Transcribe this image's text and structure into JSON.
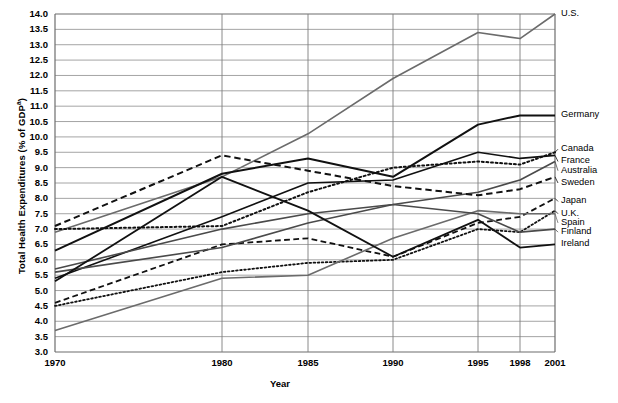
{
  "chart_data": {
    "type": "line",
    "title": "",
    "xlabel": "Year",
    "ylabel": "Total Health Expenditures (% of GDP",
    "ylabel_superscript": "a",
    "x": [
      1970,
      1980,
      1985,
      1990,
      1995,
      1998,
      2001
    ],
    "xtick_labels": [
      "1970",
      "1980",
      "1985",
      "1990",
      "1995",
      "1998",
      "2001"
    ],
    "ytick_labels": [
      "14.0",
      "13.5",
      "13.0",
      "12.5",
      "12.0",
      "11.5",
      "11.0",
      "10.5",
      "10.0",
      "9.5",
      "9.0",
      "8.5",
      "8.0",
      "7.5",
      "7.0",
      "6.5",
      "6.0",
      "5.5",
      "5.0",
      "4.5",
      "4.0",
      "3.5",
      "3.0"
    ],
    "ylim": [
      3.0,
      14.0
    ],
    "ytick_step": 0.5,
    "grid": true,
    "legend": "right-of-axis-series-labels",
    "series": [
      {
        "name": "U.S.",
        "values": [
          6.9,
          8.7,
          10.1,
          11.9,
          13.4,
          13.2,
          14.0
        ],
        "style": "solid",
        "color": "#6b6b6b",
        "width": 1.6,
        "label_y": 14.0
      },
      {
        "name": "Germany",
        "values": [
          6.3,
          8.8,
          9.3,
          8.7,
          10.4,
          10.7,
          10.7
        ],
        "style": "solid",
        "color": "#111111",
        "width": 2.0,
        "label_y": 10.7
      },
      {
        "name": "Canada",
        "values": [
          7.0,
          7.1,
          8.2,
          9.0,
          9.2,
          9.1,
          9.5
        ],
        "style": "dotted",
        "color": "#111111",
        "width": 2.0,
        "label_y": 9.6
      },
      {
        "name": "France",
        "values": [
          5.4,
          7.4,
          8.5,
          8.6,
          9.5,
          9.3,
          9.4
        ],
        "style": "solid",
        "color": "#111111",
        "width": 1.6,
        "label_y": 9.2
      },
      {
        "name": "Australia",
        "values": [
          5.7,
          7.0,
          7.5,
          7.8,
          8.2,
          8.6,
          9.2
        ],
        "style": "solid",
        "color": "#4a4a4a",
        "width": 1.6,
        "label_y": 8.9
      },
      {
        "name": "Sweden",
        "values": [
          7.1,
          9.4,
          8.9,
          8.4,
          8.1,
          8.3,
          8.7
        ],
        "style": "dashed",
        "color": "#111111",
        "width": 2.0,
        "label_y": 8.5
      },
      {
        "name": "Japan",
        "values": [
          4.6,
          6.5,
          6.7,
          6.1,
          7.2,
          7.4,
          8.0
        ],
        "style": "dashed",
        "color": "#111111",
        "width": 1.8,
        "label_y": 7.9
      },
      {
        "name": "U.K.",
        "values": [
          4.5,
          5.6,
          5.9,
          6.0,
          7.0,
          6.9,
          7.6
        ],
        "style": "dotted",
        "color": "#111111",
        "width": 1.8,
        "label_y": 7.5
      },
      {
        "name": "Spain",
        "values": [
          3.7,
          5.4,
          5.5,
          6.7,
          7.6,
          7.5,
          7.5
        ],
        "style": "solid",
        "color": "#6b6b6b",
        "width": 1.6,
        "label_y": 7.2
      },
      {
        "name": "Finland",
        "values": [
          5.6,
          6.4,
          7.2,
          7.8,
          7.5,
          6.9,
          7.0
        ],
        "style": "solid",
        "color": "#4a4a4a",
        "width": 1.6,
        "label_y": 6.9
      },
      {
        "name": "Ireland",
        "values": [
          5.3,
          8.7,
          7.6,
          6.1,
          7.3,
          6.4,
          6.5
        ],
        "style": "solid",
        "color": "#111111",
        "width": 1.8,
        "label_y": 6.5
      }
    ]
  }
}
